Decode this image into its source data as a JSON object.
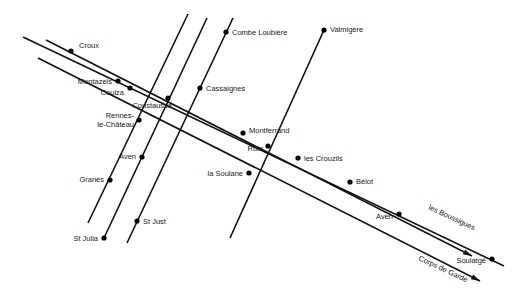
{
  "map": {
    "type": "schematic-road-network",
    "towns": [
      {
        "name": "Croux",
        "x": 71,
        "y": 51,
        "lx": 79,
        "ly": 48,
        "anchor": "start"
      },
      {
        "name": "Montazels",
        "x": 118,
        "y": 81,
        "lx": 112,
        "ly": 84,
        "anchor": "end"
      },
      {
        "name": "Couiza",
        "x": 130,
        "y": 88,
        "lx": 124,
        "ly": 95,
        "anchor": "end"
      },
      {
        "name": "Coustaussa",
        "x": 168,
        "y": 98,
        "lx": 172,
        "ly": 108,
        "anchor": "end"
      },
      {
        "name": "Rennes-",
        "x": 139,
        "y": 120,
        "lx": 134,
        "ly": 118,
        "anchor": "end"
      },
      {
        "name": "le-Château",
        "x": null,
        "y": null,
        "lx": 134,
        "ly": 127,
        "anchor": "end"
      },
      {
        "name": "Cassaignes",
        "x": 200,
        "y": 88,
        "lx": 206,
        "ly": 91,
        "anchor": "start"
      },
      {
        "name": "Combe Loubière",
        "x": 226,
        "y": 32,
        "lx": 232,
        "ly": 35,
        "anchor": "start"
      },
      {
        "name": "Valmigère",
        "x": 324,
        "y": 30,
        "lx": 330,
        "ly": 32,
        "anchor": "start"
      },
      {
        "name": "Aven",
        "x": 142,
        "y": 157,
        "lx": 136,
        "ly": 159,
        "anchor": "end"
      },
      {
        "name": "Granès",
        "x": 110,
        "y": 180,
        "lx": 104,
        "ly": 182,
        "anchor": "end"
      },
      {
        "name": "St Julia",
        "x": 104,
        "y": 238,
        "lx": 98,
        "ly": 241,
        "anchor": "end"
      },
      {
        "name": "St Just",
        "x": 137,
        "y": 221,
        "lx": 143,
        "ly": 224,
        "anchor": "start"
      },
      {
        "name": "Montferrand",
        "x": 243,
        "y": 133,
        "lx": 249,
        "ly": 133,
        "anchor": "start"
      },
      {
        "name": "Ruin",
        "x": 268,
        "y": 146,
        "lx": 263,
        "ly": 151,
        "anchor": "end"
      },
      {
        "name": "la Soulane",
        "x": 249,
        "y": 173,
        "lx": 243,
        "ly": 176,
        "anchor": "end"
      },
      {
        "name": "les Crouzils",
        "x": 298,
        "y": 158,
        "lx": 304,
        "ly": 161,
        "anchor": "start"
      },
      {
        "name": "Bélot",
        "x": 350,
        "y": 182,
        "lx": 356,
        "ly": 184,
        "anchor": "start"
      },
      {
        "name": "Aven",
        "x": 399,
        "y": 214,
        "lx": 393,
        "ly": 219,
        "anchor": "end"
      },
      {
        "name": "Soulatgé",
        "x": 492,
        "y": 259,
        "lx": 486,
        "ly": 263,
        "anchor": "end"
      }
    ],
    "directions": [
      {
        "label": "les Boussigues",
        "x": 428,
        "y": 209,
        "angle": 25
      },
      {
        "label": "Corps de Garde",
        "x": 418,
        "y": 260,
        "angle": 25
      }
    ],
    "roads": [
      {
        "id": "road-montazels-soulatge",
        "x1": 23,
        "y1": 37,
        "x2": 504,
        "y2": 266
      },
      {
        "id": "road-croux-boussigues",
        "x1": 46,
        "y1": 40,
        "x2": 472,
        "y2": 256
      },
      {
        "id": "road-rennes-corps-de-garde",
        "x1": 38,
        "y1": 58,
        "x2": 480,
        "y2": 281
      },
      {
        "id": "road-granes",
        "x1": 88,
        "y1": 223,
        "x2": 188,
        "y2": 14
      },
      {
        "id": "road-st-julia",
        "x1": 104,
        "y1": 238,
        "x2": 207,
        "y2": 18
      },
      {
        "id": "road-st-just",
        "x1": 127,
        "y1": 243,
        "x2": 233,
        "y2": 18
      },
      {
        "id": "road-valmigere",
        "x1": 230,
        "y1": 238,
        "x2": 324,
        "y2": 30
      }
    ]
  }
}
